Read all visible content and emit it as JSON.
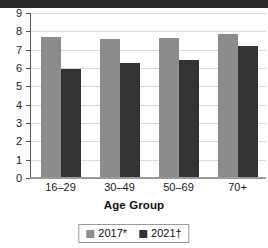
{
  "chart_data": {
    "type": "bar",
    "title": "",
    "subtitle": "",
    "xlabel": "Age Group",
    "ylabel": "",
    "categories": [
      "16–29",
      "30–49",
      "50–69",
      "70+"
    ],
    "series": [
      {
        "name": "2017*",
        "color": "#8c8c8c",
        "values": [
          7.7,
          7.6,
          7.65,
          7.85
        ]
      },
      {
        "name": "2021†",
        "color": "#333333",
        "values": [
          5.95,
          6.3,
          6.45,
          7.2
        ]
      }
    ],
    "ylim": [
      0,
      9
    ],
    "ytick_labels": [
      "9",
      "8",
      "7",
      "6",
      "5",
      "4",
      "3",
      "2",
      "1",
      "0"
    ],
    "ytick_values": [
      9,
      8,
      7,
      6,
      5,
      4,
      3,
      2,
      1,
      0
    ],
    "grid": true,
    "legend_position": "bottom"
  },
  "legend": {
    "items": [
      {
        "label": "2017*",
        "color": "#8c8c8c"
      },
      {
        "label": "2021†",
        "color": "#333333"
      }
    ]
  },
  "axes": {
    "x_title": "Age Group"
  },
  "colors": {
    "series_2017": "#8c8c8c",
    "series_2021": "#333333",
    "gridline": "#d9d9d9",
    "axis": "#555555",
    "background": "#ffffff"
  }
}
